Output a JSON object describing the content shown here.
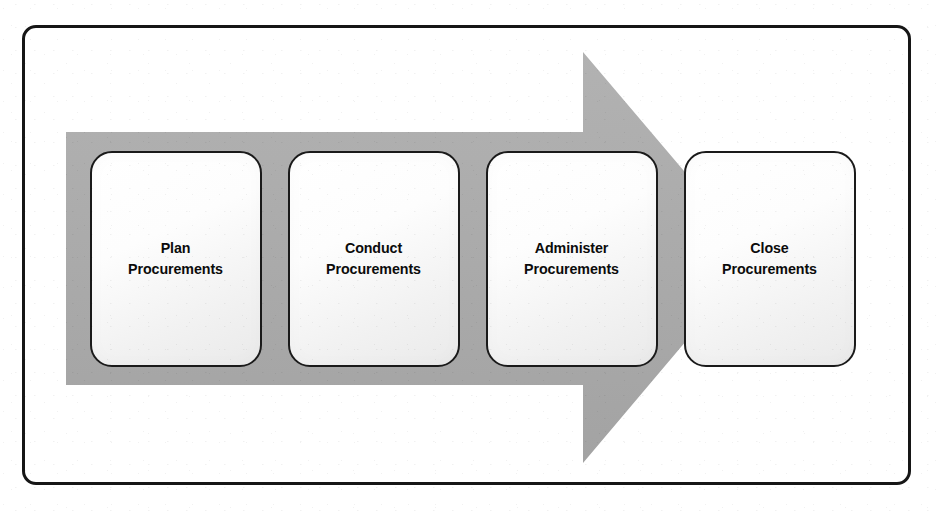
{
  "diagram": {
    "frame": {
      "border_color": "#161616",
      "background_color": "#ffffff"
    },
    "arrow": {
      "name": "process-flow-arrow",
      "direction": "right",
      "fill_color": "#ababab",
      "shaft_top_y": 132,
      "shaft_bottom_y": 385,
      "head_top_y": 52,
      "head_bottom_y": 463,
      "tip_x": 757
    },
    "stages": [
      {
        "index": 1,
        "label": "Plan\nProcurements",
        "line1": "Plan",
        "line2": "Procurements",
        "fill_color": "#f4f4f4",
        "border_color": "#1a1a1a"
      },
      {
        "index": 2,
        "label": "Conduct\nProcurements",
        "line1": "Conduct",
        "line2": "Procurements",
        "fill_color": "#f4f4f4",
        "border_color": "#1a1a1a"
      },
      {
        "index": 3,
        "label": "Administer\nProcurements",
        "line1": "Administer",
        "line2": "Procurements",
        "fill_color": "#f4f4f4",
        "border_color": "#1a1a1a"
      },
      {
        "index": 4,
        "label": "Close\nProcurements",
        "line1": "Close",
        "line2": "Procurements",
        "fill_color": "#f4f4f4",
        "border_color": "#1a1a1a"
      }
    ]
  }
}
